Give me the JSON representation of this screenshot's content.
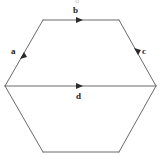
{
  "figure": {
    "type": "geometry-diagram",
    "shape_name": "hexagon",
    "background_color": "#ffffff",
    "stroke_color": "#6a6a6a",
    "label_color": "#1a1a1a",
    "stroke_width": 1,
    "labels": {
      "a": "a",
      "b": "b",
      "c": "c",
      "d": "d"
    },
    "edges": [
      {
        "id": "a",
        "label": "a",
        "description": "upper-left side of hexagon, arrow pointing up-right",
        "x1": 5,
        "y1": 86,
        "x2": 43,
        "y2": 20,
        "arrow_direction": "up-right",
        "arrow_at": [
          24,
          53
        ]
      },
      {
        "id": "b",
        "label": "b",
        "description": "top side of hexagon, arrow pointing right",
        "x1": 43,
        "y1": 20,
        "x2": 119,
        "y2": 20,
        "arrow_direction": "right",
        "arrow_at": [
          81,
          20
        ]
      },
      {
        "id": "c",
        "label": "c",
        "description": "upper-right side of hexagon, arrow pointing down-right",
        "x1": 119,
        "y1": 20,
        "x2": 156,
        "y2": 86,
        "arrow_direction": "down-right",
        "arrow_at": [
          138,
          53
        ]
      },
      {
        "id": "d",
        "label": "d",
        "description": "horizontal diameter of hexagon, arrow pointing right",
        "x1": 5,
        "y1": 86,
        "x2": 156,
        "y2": 86,
        "arrow_direction": "right",
        "arrow_at": [
          81,
          86
        ]
      }
    ],
    "unlabeled_edges": [
      {
        "id": "lower-left",
        "description": "lower-left side of hexagon",
        "x1": 5,
        "y1": 86,
        "x2": 43,
        "y2": 152
      },
      {
        "id": "bottom",
        "description": "bottom side of hexagon",
        "x1": 43,
        "y1": 152,
        "x2": 119,
        "y2": 152
      },
      {
        "id": "lower-right",
        "description": "lower-right side of hexagon",
        "x1": 119,
        "y1": 152,
        "x2": 156,
        "y2": 86
      }
    ],
    "label_positions": {
      "a": {
        "x": 11,
        "y": 47
      },
      "b": {
        "x": 73,
        "y": 6
      },
      "c": {
        "x": 142,
        "y": 47
      },
      "d": {
        "x": 76,
        "y": 92
      }
    },
    "top_artifact_text": "b"
  }
}
